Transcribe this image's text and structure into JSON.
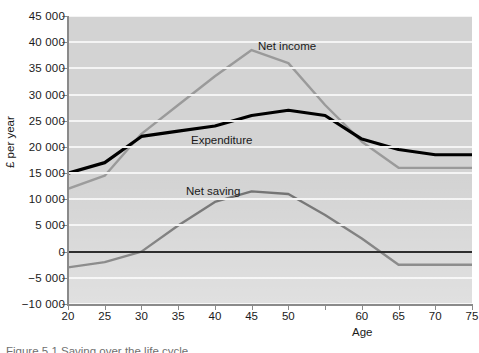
{
  "axes": {
    "y_title": "£ per year",
    "x_title": "Age",
    "y_ticks": [
      "45 000",
      "40 000",
      "35 000",
      "30 000",
      "25 000",
      "20 000",
      "15 000",
      "10 000",
      "5 000",
      "0",
      "−5 000",
      "−10 000"
    ],
    "x_ticks": [
      "20",
      "25",
      "30",
      "35",
      "40",
      "45",
      "50",
      "",
      "60",
      "65",
      "70",
      "75"
    ]
  },
  "series_labels": {
    "net_income": "Net income",
    "expenditure": "Expenditure",
    "net_saving": "Net saving"
  },
  "caption": "Figure 5.1  Saving over the life cycle",
  "colors": {
    "net_income": "#9a9a9a",
    "expenditure": "#000000",
    "net_saving": "#6e6e6e",
    "plot_background": "#d3d3d3",
    "gridline": "#f4f4f4",
    "axis": "#8a8a8a"
  },
  "chart_data": {
    "type": "line",
    "title": "",
    "xlabel": "Age",
    "ylabel": "£ per year",
    "xlim": [
      20,
      75
    ],
    "ylim": [
      -10000,
      45000
    ],
    "grid": true,
    "legend": "inline labels",
    "x": [
      20,
      25,
      30,
      35,
      40,
      45,
      50,
      55,
      60,
      65,
      70,
      75
    ],
    "series": [
      {
        "name": "Net income",
        "color": "#9a9a9a",
        "values": [
          12000,
          14500,
          22500,
          28000,
          33500,
          38500,
          36000,
          28000,
          21000,
          16000,
          16000,
          16000
        ]
      },
      {
        "name": "Expenditure",
        "color": "#000000",
        "values": [
          15000,
          17000,
          22000,
          23000,
          24000,
          26000,
          27000,
          26000,
          21500,
          19500,
          18500,
          18500
        ]
      },
      {
        "name": "Net saving",
        "color": "#6e6e6e",
        "values": [
          -3000,
          -2000,
          0,
          5000,
          9500,
          11500,
          11000,
          7000,
          2500,
          -2500,
          -2500,
          -2500
        ]
      }
    ]
  }
}
